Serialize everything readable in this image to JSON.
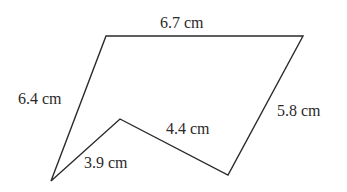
{
  "diagram": {
    "type": "polygon",
    "vertices": [
      {
        "id": "top-left",
        "x": 106,
        "y": 36
      },
      {
        "id": "top-right",
        "x": 303,
        "y": 36
      },
      {
        "id": "bottom-right",
        "x": 228,
        "y": 175
      },
      {
        "id": "inner-notch",
        "x": 120,
        "y": 119
      },
      {
        "id": "bottom-left",
        "x": 51,
        "y": 181
      }
    ],
    "sides": [
      {
        "from": "top-left",
        "to": "top-right",
        "label": "6.7 cm",
        "length": 6.7
      },
      {
        "from": "top-right",
        "to": "bottom-right",
        "label": "5.8 cm",
        "length": 5.8
      },
      {
        "from": "bottom-right",
        "to": "inner-notch",
        "label": "4.4 cm",
        "length": 4.4
      },
      {
        "from": "inner-notch",
        "to": "bottom-left",
        "label": "3.9 cm",
        "length": 3.9
      },
      {
        "from": "bottom-left",
        "to": "top-left",
        "label": "6.4 cm",
        "length": 6.4
      }
    ],
    "unit": "cm",
    "colors": {
      "stroke": "#2a2a2a",
      "text": "#2a2a2a",
      "background": "#ffffff"
    }
  },
  "labels": {
    "top": "6.7 cm",
    "right": "5.8 cm",
    "inner_right": "4.4 cm",
    "inner_left": "3.9 cm",
    "left": "6.4 cm"
  }
}
